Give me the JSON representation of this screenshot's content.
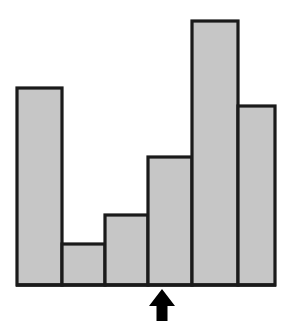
{
  "figure": {
    "background_color": "#ffffff",
    "width": 291,
    "height": 335
  },
  "chart_data": {
    "type": "bar",
    "title": "",
    "subtitle": "",
    "xlabel": "",
    "ylabel": "",
    "grid": false,
    "legend": null,
    "categories": [
      "1",
      "2",
      "3",
      "4",
      "5",
      "6"
    ],
    "values": [
      73,
      16,
      26,
      49,
      99,
      67
    ],
    "ylim": [
      0,
      100
    ],
    "xlim": [
      0,
      6
    ],
    "bar_edges_px": [
      17,
      62,
      105,
      148,
      192,
      238,
      275
    ],
    "bar_tops_px": [
      88,
      244,
      215,
      157,
      21,
      106
    ],
    "baseline_px": 285,
    "bar_fill_color": "#c6c6c6",
    "bar_edge_color": "#1a1a1a",
    "annotations": [
      {
        "name": "pointer-arrow",
        "type": "arrow",
        "direction": "up",
        "label": "",
        "target_bin": "4",
        "x_px": 162,
        "tip_y_px": 289,
        "tail_y_px": 321,
        "color": "#000000"
      }
    ]
  }
}
